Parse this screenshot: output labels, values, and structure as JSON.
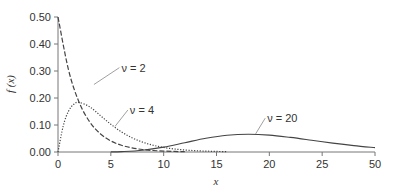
{
  "chart_data": {
    "type": "line",
    "title": "",
    "xlabel": "x",
    "ylabel": "f (x)",
    "xlim": [
      0,
      30
    ],
    "ylim": [
      0,
      0.5
    ],
    "grid": false,
    "legend": "inline labels with leader lines",
    "x_ticks": [
      {
        "value": 0,
        "label": "0"
      },
      {
        "value": 5,
        "label": "5"
      },
      {
        "value": 10,
        "label": "10"
      },
      {
        "value": 15,
        "label": "15"
      },
      {
        "value": 20,
        "label": "20"
      },
      {
        "value": 25,
        "label": "25"
      },
      {
        "value": 30,
        "label": "50"
      }
    ],
    "y_ticks": [
      {
        "value": 0.0,
        "label": "0.00"
      },
      {
        "value": 0.1,
        "label": "0.10"
      },
      {
        "value": 0.2,
        "label": "0.20"
      },
      {
        "value": 0.3,
        "label": "0.30"
      },
      {
        "value": 0.4,
        "label": "0.40"
      },
      {
        "value": 0.5,
        "label": "0.50"
      }
    ],
    "series": [
      {
        "name": "ν = 2",
        "label": "ν = 2",
        "style": "dashed",
        "x": [
          0,
          1,
          2,
          3,
          4,
          5,
          6,
          7,
          8,
          9,
          10,
          11,
          12
        ],
        "values": [
          0.5,
          0.3033,
          0.1839,
          0.1116,
          0.0677,
          0.041,
          0.0249,
          0.0151,
          0.0092,
          0.0056,
          0.0034,
          0.002,
          0.0012
        ],
        "label_pos": {
          "x": 6.0,
          "y": 0.305
        },
        "leader_to": {
          "x": 3.4,
          "y": 0.25
        }
      },
      {
        "name": "ν = 4",
        "label": "ν = 4",
        "style": "dotted",
        "x": [
          0,
          0.5,
          1,
          1.5,
          2,
          3,
          4,
          5,
          6,
          7,
          8,
          9,
          10,
          11,
          12,
          13,
          14,
          15,
          16
        ],
        "values": [
          0,
          0.0974,
          0.1516,
          0.1771,
          0.1839,
          0.1673,
          0.1353,
          0.1026,
          0.0747,
          0.0528,
          0.0366,
          0.025,
          0.0168,
          0.0113,
          0.0074,
          0.0049,
          0.0032,
          0.0021,
          0.0013
        ],
        "label_pos": {
          "x": 6.8,
          "y": 0.148
        },
        "leader_to": {
          "x": 5.4,
          "y": 0.095
        }
      },
      {
        "name": "ν = 20",
        "label": "ν = 20",
        "style": "solid",
        "x": [
          5,
          6,
          8,
          10,
          12,
          14,
          16,
          18,
          20,
          22,
          24,
          26,
          28,
          30
        ],
        "values": [
          0.0004,
          0.0014,
          0.0066,
          0.0181,
          0.0344,
          0.0507,
          0.062,
          0.0659,
          0.0626,
          0.054,
          0.0437,
          0.033,
          0.0237,
          0.0162
        ],
        "label_pos": {
          "x": 19.8,
          "y": 0.118
        },
        "leader_to": {
          "x": 18.7,
          "y": 0.067
        }
      }
    ]
  },
  "layout": {
    "plot_left_px": 58,
    "plot_bottom_px": 152,
    "plot_top_px": 17,
    "plot_right_px": 375
  },
  "colors": {
    "curve": "#444444",
    "axis": "#777777",
    "text": "#333333"
  }
}
